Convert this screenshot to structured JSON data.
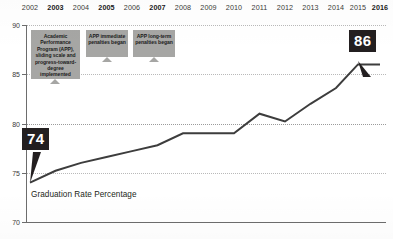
{
  "chart_data": {
    "type": "line",
    "title": "",
    "xlabel": "",
    "ylabel": "",
    "series_label": "Graduation Rate Percentage",
    "grid": true,
    "legend_position": "inline",
    "ylim": [
      70,
      90
    ],
    "yticks": [
      70,
      75,
      80,
      85,
      90
    ],
    "ytick_labels": [
      "70",
      "75",
      "80",
      "85",
      "90"
    ],
    "categories": [
      "2002",
      "2003",
      "2004",
      "2005",
      "2006",
      "2007",
      "2008",
      "2009",
      "2010",
      "2011",
      "2012",
      "2013",
      "2014",
      "2015",
      "2016"
    ],
    "bold_categories": [
      "2003",
      "2005",
      "2007",
      "2016"
    ],
    "values": [
      74,
      75.2,
      76.0,
      76.6,
      77.2,
      77.8,
      79.0,
      79.0,
      79.0,
      81.0,
      80.2,
      82.0,
      83.6,
      86.0,
      86.0
    ],
    "start_value_label": "74",
    "end_value_label": "86",
    "annotations": [
      {
        "id": "app-implemented",
        "text": "Academic Performance Program (APP), sliding scale and progress-toward-degree implemented",
        "anchor_year": "2003"
      },
      {
        "id": "app-immediate-penalties",
        "text": "APP immediate penalties began",
        "anchor_year": "2005"
      },
      {
        "id": "app-longterm-penalties",
        "text": "APP long-term penalties began",
        "anchor_year": "2007"
      }
    ],
    "colors": {
      "line": "#3d3d3d",
      "flag_background": "#231f20",
      "flag_text": "#ffffff",
      "note_background": "#a6a6a4",
      "grid": "#b9b9b9",
      "axis": "#6d6d6d",
      "text": "#231f20"
    }
  }
}
